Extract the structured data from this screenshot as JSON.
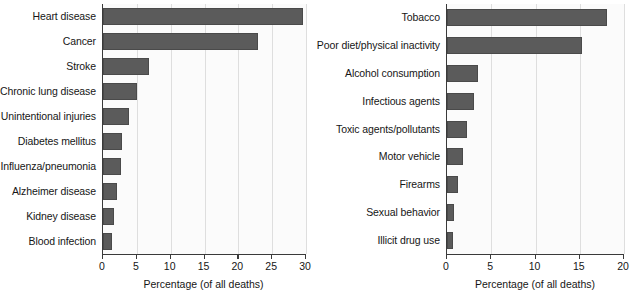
{
  "chart_data": [
    {
      "id": "leading-causes-of-death",
      "type": "bar",
      "orientation": "horizontal",
      "title": "",
      "xlabel": "Percentage (of all deaths)",
      "ylabel": "",
      "xlim": [
        0,
        30
      ],
      "xticks": [
        0,
        5,
        10,
        15,
        20,
        25,
        30
      ],
      "xtick_labels": [
        "0",
        "5",
        "10",
        "15",
        "20",
        "25",
        "30"
      ],
      "grid": "vertical",
      "legend": "none",
      "bar_color": "#5b5b5b",
      "categories": [
        "Heart disease",
        "Cancer",
        "Stroke",
        "Chronic lung disease",
        "Unintentional injuries",
        "Diabetes mellitus",
        "Influenza/pneumonia",
        "Alzheimer disease",
        "Kidney disease",
        "Blood infection"
      ],
      "values": [
        29.5,
        22.9,
        6.8,
        5.0,
        3.9,
        2.8,
        2.6,
        2.0,
        1.6,
        1.3
      ]
    },
    {
      "id": "actual-causes-of-death",
      "type": "bar",
      "orientation": "horizontal",
      "title": "",
      "xlabel": "Percentage (of all deaths)",
      "ylabel": "",
      "xlim": [
        0,
        20
      ],
      "xticks": [
        0,
        5,
        10,
        15,
        20
      ],
      "xtick_labels": [
        "0",
        "5",
        "10",
        "15",
        "20"
      ],
      "grid": "vertical",
      "legend": "none",
      "bar_color": "#5b5b5b",
      "categories": [
        "Tobacco",
        "Poor diet/physical inactivity",
        "Alcohol consumption",
        "Infectious agents",
        "Toxic agents/pollutants",
        "Motor vehicle",
        "Firearms",
        "Sexual behavior",
        "Illicit drug use"
      ],
      "values": [
        18.1,
        15.2,
        3.5,
        3.1,
        2.3,
        1.8,
        1.2,
        0.8,
        0.7
      ]
    }
  ],
  "panels": {
    "left": {
      "axis_title": "Percentage (of all deaths)"
    },
    "right": {
      "axis_title": "Percentage (of all deaths)"
    }
  }
}
